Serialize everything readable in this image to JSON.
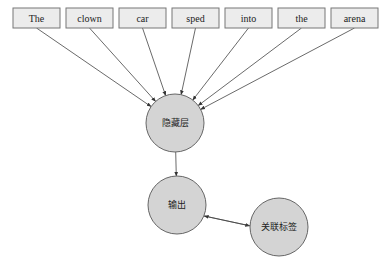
{
  "diagram": {
    "input_words": [
      "The",
      "clown",
      "car",
      "sped",
      "into",
      "the",
      "arena"
    ],
    "nodes": {
      "hidden": "隐藏层",
      "output": "输出",
      "label": "关联标签"
    },
    "edges": [
      {
        "from": "word-0",
        "to": "hidden"
      },
      {
        "from": "word-1",
        "to": "hidden"
      },
      {
        "from": "word-2",
        "to": "hidden"
      },
      {
        "from": "word-3",
        "to": "hidden"
      },
      {
        "from": "word-4",
        "to": "hidden"
      },
      {
        "from": "word-5",
        "to": "hidden"
      },
      {
        "from": "word-6",
        "to": "hidden"
      },
      {
        "from": "hidden",
        "to": "output"
      },
      {
        "from": "output",
        "to": "label"
      },
      {
        "from": "label",
        "to": "output"
      }
    ]
  }
}
